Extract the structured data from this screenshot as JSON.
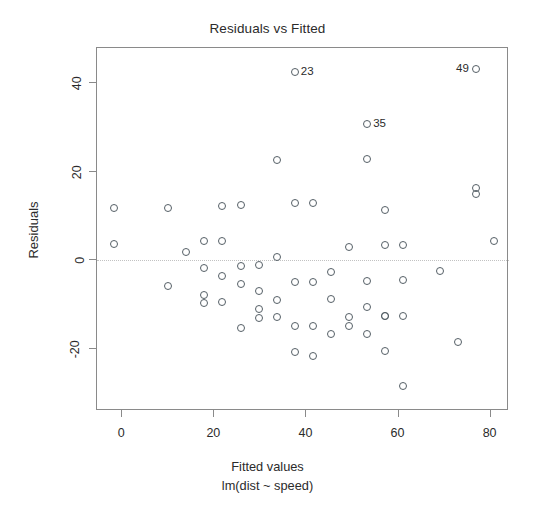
{
  "chart_data": {
    "type": "scatter",
    "title": "Residuals vs Fitted",
    "xlabel": "Fitted values",
    "xlabel_sub": "lm(dist ~ speed)",
    "ylabel": "Residuals",
    "xlim": [
      -5.5,
      84
    ],
    "ylim": [
      -34,
      48
    ],
    "xticks": [
      0,
      20,
      40,
      60,
      80
    ],
    "yticks": [
      -20,
      0,
      20,
      40
    ],
    "grid": false,
    "legend": null,
    "reference_line": {
      "y": 0,
      "style": "dotted",
      "color": "#c2c2c2"
    },
    "point_style": {
      "marker": "open-circle",
      "color": "#555f66",
      "size": 8
    },
    "x": [
      -1.85,
      -1.85,
      9.95,
      9.95,
      13.88,
      17.81,
      17.81,
      17.81,
      17.81,
      21.74,
      21.74,
      21.74,
      21.74,
      25.68,
      25.68,
      25.68,
      25.68,
      29.61,
      29.61,
      29.61,
      29.61,
      33.54,
      33.54,
      33.54,
      33.54,
      37.47,
      37.47,
      37.47,
      37.47,
      37.47,
      41.41,
      41.41,
      41.41,
      41.41,
      45.34,
      45.34,
      45.34,
      49.27,
      49.27,
      49.27,
      53.2,
      53.2,
      53.2,
      53.2,
      53.2,
      57.14,
      57.14,
      57.14,
      57.14,
      57.14,
      61.07,
      61.07,
      61.07,
      61.07,
      68.93,
      72.87,
      76.8,
      76.8,
      76.8,
      80.73
    ],
    "y": [
      11.8,
      3.8,
      11.8,
      -5.8,
      1.9,
      -7.7,
      4.3,
      -9.6,
      -1.6,
      12.3,
      4.5,
      -3.5,
      -9.4,
      12.6,
      -1.3,
      -5.3,
      -15.3,
      -1.1,
      -7.0,
      -11.0,
      -12.9,
      22.7,
      0.9,
      -8.9,
      -12.8,
      42.5,
      12.9,
      -4.8,
      -14.7,
      -20.7,
      12.9,
      -4.8,
      -14.7,
      -21.6,
      -2.6,
      -8.6,
      -16.6,
      3.1,
      -12.7,
      -14.7,
      30.8,
      22.9,
      -4.6,
      -10.6,
      -16.5,
      11.4,
      3.4,
      -12.5,
      -12.5,
      -20.5,
      3.5,
      -4.5,
      -12.5,
      -28.4,
      -2.4,
      -18.4,
      43.2,
      16.3,
      15.0,
      4.4
    ],
    "labeled_points": [
      {
        "label": "23",
        "x": 37.47,
        "y": 42.5,
        "label_side": "right"
      },
      {
        "label": "35",
        "x": 53.2,
        "y": 30.8,
        "label_side": "right"
      },
      {
        "label": "49",
        "x": 76.8,
        "y": 43.2,
        "label_side": "left"
      }
    ]
  },
  "axis": {
    "xticklabels": [
      "0",
      "20",
      "40",
      "60",
      "80"
    ],
    "yticklabels": [
      "-20",
      "0",
      "20",
      "40"
    ]
  }
}
